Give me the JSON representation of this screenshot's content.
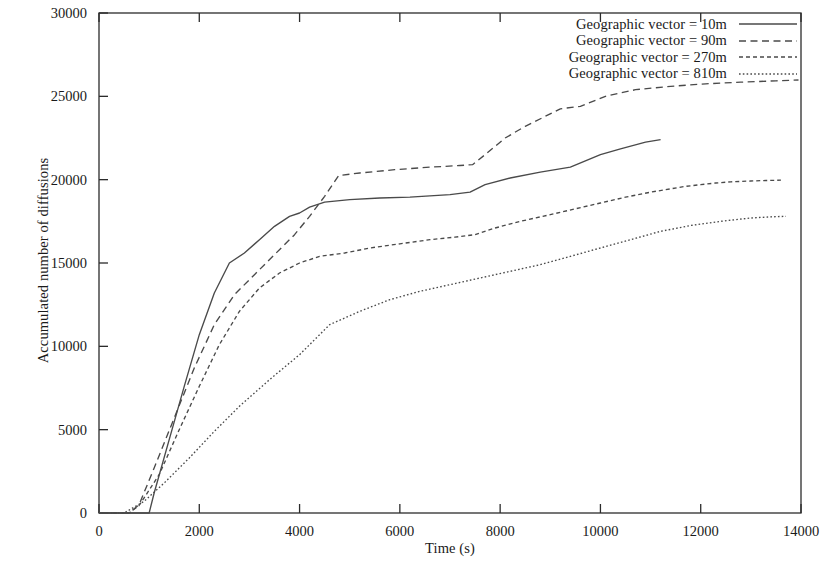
{
  "chart_data": {
    "type": "line",
    "title": "",
    "xlabel": "Time (s)",
    "ylabel": "Accumulated number of diffusions",
    "xlim": [
      0,
      14000
    ],
    "ylim": [
      0,
      30000
    ],
    "xticks": [
      0,
      2000,
      4000,
      6000,
      8000,
      10000,
      12000,
      14000
    ],
    "yticks": [
      0,
      5000,
      10000,
      15000,
      20000,
      25000,
      30000
    ],
    "xtick_labels": [
      "0",
      "2000",
      "4000",
      "6000",
      "8000",
      "10000",
      "12000",
      "14000"
    ],
    "ytick_labels": [
      "0",
      "5000",
      "10000",
      "15000",
      "20000",
      "25000",
      "30000"
    ],
    "grid": false,
    "legend_position": "top-right",
    "series": [
      {
        "name": "Geographic vector = 10m",
        "dash": "solid",
        "x": [
          0,
          600,
          1000,
          1100,
          1400,
          1700,
          2000,
          2300,
          2600,
          2900,
          3200,
          3500,
          3800,
          4000,
          4200,
          4500,
          5000,
          5600,
          6200,
          7000,
          7400,
          7700,
          8200,
          8800,
          9400,
          10000,
          10400,
          10900,
          11200
        ],
        "y": [
          0,
          0,
          0,
          1200,
          4400,
          7600,
          10700,
          13200,
          15000,
          15600,
          16400,
          17200,
          17800,
          18000,
          18350,
          18650,
          18800,
          18900,
          18950,
          19100,
          19250,
          19700,
          20100,
          20450,
          20750,
          21500,
          21850,
          22250,
          22400
        ]
      },
      {
        "name": "Geographic vector = 90m",
        "dash": "dashed",
        "x": [
          0,
          600,
          800,
          1100,
          1500,
          1900,
          2300,
          2700,
          3100,
          3500,
          3900,
          4200,
          4500,
          4780,
          5200,
          5900,
          6600,
          7200,
          7450,
          7700,
          8100,
          8500,
          8900,
          9200,
          9600,
          10100,
          10700,
          11400,
          12100,
          12800,
          13500,
          13950
        ],
        "y": [
          0,
          0,
          500,
          2700,
          5700,
          8700,
          11300,
          13100,
          14300,
          15500,
          16700,
          17800,
          19000,
          20250,
          20400,
          20600,
          20750,
          20850,
          20900,
          21500,
          22500,
          23200,
          23800,
          24250,
          24400,
          25000,
          25400,
          25600,
          25750,
          25850,
          25930,
          25980
        ]
      },
      {
        "name": "Geographic vector = 270m",
        "dash": "dotted-dash",
        "x": [
          0,
          600,
          800,
          1200,
          1600,
          2000,
          2400,
          2800,
          3200,
          3600,
          4000,
          4400,
          4900,
          5400,
          6000,
          6600,
          7100,
          7500,
          7900,
          8400,
          9000,
          9500,
          10000,
          10500,
          11000,
          11400,
          11700,
          12000,
          12300,
          12600,
          13000,
          13300,
          13600
        ],
        "y": [
          0,
          0,
          450,
          2300,
          5000,
          7600,
          10100,
          12100,
          13500,
          14400,
          15000,
          15400,
          15600,
          15900,
          16150,
          16400,
          16550,
          16700,
          17100,
          17500,
          17900,
          18250,
          18600,
          18950,
          19250,
          19450,
          19600,
          19700,
          19800,
          19870,
          19920,
          19950,
          19970
        ]
      },
      {
        "name": "Geographic vector = 810m",
        "dash": "dotted",
        "x": [
          0,
          500,
          900,
          1300,
          1800,
          2300,
          2800,
          3400,
          4000,
          4600,
          5200,
          5800,
          6400,
          7000,
          7600,
          8200,
          8800,
          9400,
          10000,
          10600,
          11200,
          11800,
          12400,
          13000,
          13400,
          13700
        ],
        "y": [
          0,
          0,
          700,
          1800,
          3300,
          4900,
          6400,
          8000,
          9500,
          11300,
          12100,
          12800,
          13300,
          13700,
          14100,
          14500,
          14900,
          15400,
          15900,
          16400,
          16900,
          17250,
          17500,
          17700,
          17770,
          17800
        ]
      }
    ]
  },
  "legend": {
    "entries": [
      {
        "label": "Geographic vector = 10m"
      },
      {
        "label": "Geographic vector = 90m"
      },
      {
        "label": "Geographic vector = 270m"
      },
      {
        "label": "Geographic vector = 810m"
      }
    ]
  },
  "colors": {
    "line": "#4a4a4a",
    "axis": "#2b2b2b",
    "background": "#ffffff",
    "text": "#1a1a1a"
  }
}
